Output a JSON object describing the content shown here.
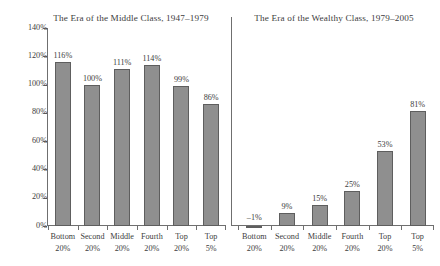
{
  "chart_data": {
    "type": "bar",
    "title": "",
    "panels": [
      {
        "title": "The Era of the Middle Class, 1947–1979",
        "categories": [
          {
            "line1": "Bottom",
            "line2": "20%"
          },
          {
            "line1": "Second",
            "line2": "20%"
          },
          {
            "line1": "Middle",
            "line2": "20%"
          },
          {
            "line1": "Fourth",
            "line2": "20%"
          },
          {
            "line1": "Top",
            "line2": "20%"
          },
          {
            "line1": "Top",
            "line2": "5%"
          }
        ],
        "values": [
          116,
          100,
          111,
          114,
          99,
          86
        ],
        "labels": [
          "116%",
          "100%",
          "111%",
          "114%",
          "99%",
          "86%"
        ]
      },
      {
        "title": "The Era of the Wealthy Class, 1979–2005",
        "categories": [
          {
            "line1": "Bottom",
            "line2": "20%"
          },
          {
            "line1": "Second",
            "line2": "20%"
          },
          {
            "line1": "Middle",
            "line2": "20%"
          },
          {
            "line1": "Fourth",
            "line2": "20%"
          },
          {
            "line1": "Top",
            "line2": "20%"
          },
          {
            "line1": "Top",
            "line2": "5%"
          }
        ],
        "values": [
          -1,
          9,
          15,
          25,
          53,
          81
        ],
        "labels": [
          "–1%",
          "9%",
          "15%",
          "25%",
          "53%",
          "81%"
        ]
      }
    ],
    "xlabel": "",
    "ylabel": "",
    "ylim": [
      0,
      140
    ],
    "yticks": [
      0,
      20,
      40,
      60,
      80,
      100,
      120,
      140
    ],
    "ytick_labels": [
      "0%",
      "20%",
      "40%",
      "60%",
      "80%",
      "100%",
      "120%",
      "140%"
    ],
    "grid": false,
    "legend": false,
    "colors": {
      "bar_fill": "#8f8f8f",
      "bar_edge": "#5e5e5e",
      "axis": "#6f6f6f",
      "text": "#3d3d3d",
      "background": "#ffffff"
    }
  }
}
